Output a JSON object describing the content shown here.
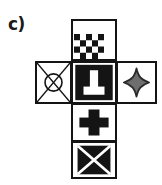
{
  "figure": {
    "label": "c)",
    "type": "cube-net",
    "colors": {
      "ink": "#141414",
      "paper": "#ffffff",
      "star_fill": "#6e6e6e",
      "star_outline": "#2a2a2a"
    },
    "faces": [
      {
        "position": "top",
        "grid": "row1-col2",
        "symbol_name": "checkerboard-pattern",
        "symbol_label": "checkerboard",
        "fill": "#ffffff"
      },
      {
        "position": "left",
        "grid": "row2-col1",
        "symbol_name": "circle-with-x",
        "symbol_label": "crossed circle",
        "fill": "#ffffff"
      },
      {
        "position": "center",
        "grid": "row2-col2",
        "symbol_name": "inverted-t-on-black",
        "symbol_label": "white pedestal on black",
        "fill": "#141414"
      },
      {
        "position": "right",
        "grid": "row2-col3",
        "symbol_name": "four-pointed-star",
        "symbol_label": "gray four-pointed star",
        "fill": "#6e6e6e"
      },
      {
        "position": "below",
        "grid": "row3-col2",
        "symbol_name": "plus-sign",
        "symbol_label": "black plus",
        "fill": "#ffffff"
      },
      {
        "position": "bottom",
        "grid": "row4-col2",
        "symbol_name": "x-on-black",
        "symbol_label": "white X on black",
        "fill": "#141414"
      }
    ]
  }
}
